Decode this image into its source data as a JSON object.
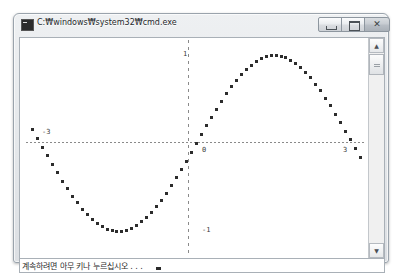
{
  "window": {
    "title": "C:₩windows₩system32₩cmd.exe",
    "icon": "console-icon",
    "controls": {
      "minimize_label": "",
      "maximize_label": "",
      "close_label": "✕"
    }
  },
  "console": {
    "prompt_text": "계속하려면 아무 키나 누르십시오 . . .",
    "scrollbar": {
      "up_label": "▲",
      "down_label": "▼"
    }
  },
  "chart_data": {
    "type": "scatter",
    "title": "",
    "xlabel": "",
    "ylabel": "",
    "xlim": [
      -3.4,
      3.4
    ],
    "ylim": [
      -1.25,
      1.25
    ],
    "grid": false,
    "legend": null,
    "axis_style": "dashed",
    "x_ticks": [
      {
        "value": -3,
        "label": "-3"
      },
      {
        "value": 0,
        "label": "0"
      },
      {
        "value": 3,
        "label": "3"
      }
    ],
    "y_ticks": [
      {
        "value": 1,
        "label": "1"
      },
      {
        "value": -1,
        "label": "-1"
      }
    ],
    "series": [
      {
        "name": "sin(x)",
        "marker": "square",
        "x": [
          -3.3,
          -3.2,
          -3.1,
          -3.0,
          -2.9,
          -2.8,
          -2.7,
          -2.6,
          -2.5,
          -2.4,
          -2.3,
          -2.2,
          -2.1,
          -2.0,
          -1.9,
          -1.8,
          -1.7,
          -1.6,
          -1.5,
          -1.4,
          -1.3,
          -1.2,
          -1.1,
          -1.0,
          -0.9,
          -0.8,
          -0.7,
          -0.6,
          -0.5,
          -0.4,
          -0.3,
          -0.2,
          -0.1,
          0.0,
          0.1,
          0.2,
          0.3,
          0.4,
          0.5,
          0.6,
          0.7,
          0.8,
          0.9,
          1.0,
          1.1,
          1.2,
          1.3,
          1.4,
          1.5,
          1.6,
          1.7,
          1.8,
          1.9,
          2.0,
          2.1,
          2.2,
          2.3,
          2.4,
          2.5,
          2.6,
          2.7,
          2.8,
          2.9,
          3.0,
          3.1,
          3.2,
          3.3
        ],
        "y": [
          0.158,
          0.058,
          -0.042,
          -0.141,
          -0.239,
          -0.335,
          -0.427,
          -0.516,
          -0.598,
          -0.675,
          -0.746,
          -0.808,
          -0.863,
          -0.909,
          -0.946,
          -0.974,
          -0.992,
          -1.0,
          -0.997,
          -0.985,
          -0.964,
          -0.932,
          -0.891,
          -0.841,
          -0.783,
          -0.717,
          -0.644,
          -0.565,
          -0.479,
          -0.389,
          -0.296,
          -0.199,
          -0.1,
          0.0,
          0.1,
          0.199,
          0.296,
          0.389,
          0.479,
          0.565,
          0.644,
          0.717,
          0.783,
          0.841,
          0.891,
          0.932,
          0.964,
          0.985,
          0.997,
          1.0,
          0.992,
          0.974,
          0.946,
          0.909,
          0.863,
          0.808,
          0.746,
          0.675,
          0.598,
          0.516,
          0.427,
          0.335,
          0.239,
          0.141,
          0.042,
          -0.058,
          -0.158
        ]
      }
    ]
  }
}
